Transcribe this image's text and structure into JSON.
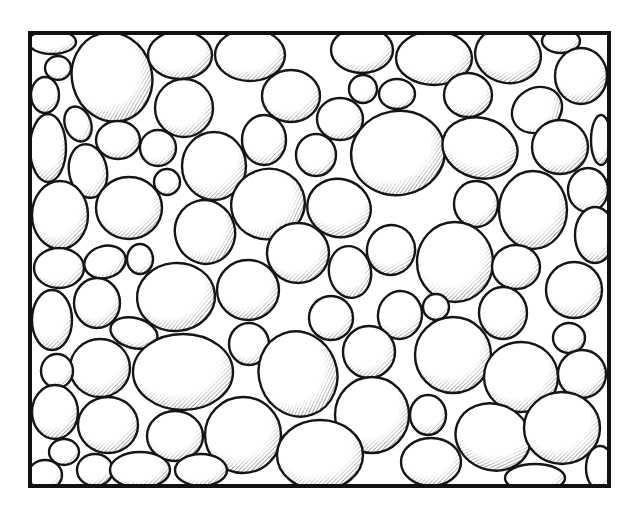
{
  "illustration": {
    "subject": "pebbles packed inside a rectangular frame",
    "style": "black ink line art with hatched shading",
    "colors": {
      "ink": "#151515",
      "background": "#ffffff",
      "hatch": "#555555"
    },
    "frame": {
      "x": 30,
      "y": 33,
      "width": 579,
      "height": 453
    },
    "pebbles": [
      {
        "cx": 52,
        "cy": 42,
        "rx": 24,
        "ry": 12,
        "rot": 0
      },
      {
        "cx": 112,
        "cy": 77,
        "rx": 40,
        "ry": 45,
        "rot": -15
      },
      {
        "cx": 180,
        "cy": 55,
        "rx": 32,
        "ry": 24,
        "rot": 0
      },
      {
        "cx": 250,
        "cy": 55,
        "rx": 35,
        "ry": 26,
        "rot": 0
      },
      {
        "cx": 58,
        "cy": 68,
        "rx": 13,
        "ry": 12,
        "rot": 0
      },
      {
        "cx": 45,
        "cy": 95,
        "rx": 14,
        "ry": 18,
        "rot": 0
      },
      {
        "cx": 184,
        "cy": 108,
        "rx": 29,
        "ry": 29,
        "rot": 0
      },
      {
        "cx": 291,
        "cy": 96,
        "rx": 29,
        "ry": 26,
        "rot": 0
      },
      {
        "cx": 48,
        "cy": 148,
        "rx": 18,
        "ry": 34,
        "rot": 0
      },
      {
        "cx": 78,
        "cy": 124,
        "rx": 13,
        "ry": 18,
        "rot": -20
      },
      {
        "cx": 118,
        "cy": 140,
        "rx": 22,
        "ry": 19,
        "rot": 0
      },
      {
        "cx": 158,
        "cy": 148,
        "rx": 18,
        "ry": 18,
        "rot": 0
      },
      {
        "cx": 88,
        "cy": 171,
        "rx": 19,
        "ry": 27,
        "rot": -10
      },
      {
        "cx": 214,
        "cy": 166,
        "rx": 32,
        "ry": 34,
        "rot": 0
      },
      {
        "cx": 264,
        "cy": 140,
        "rx": 22,
        "ry": 25,
        "rot": 0
      },
      {
        "cx": 167,
        "cy": 182,
        "rx": 13,
        "ry": 13,
        "rot": 0
      },
      {
        "cx": 362,
        "cy": 50,
        "rx": 31,
        "ry": 23,
        "rot": 0
      },
      {
        "cx": 434,
        "cy": 58,
        "rx": 38,
        "ry": 27,
        "rot": 0
      },
      {
        "cx": 508,
        "cy": 55,
        "rx": 33,
        "ry": 28,
        "rot": 10
      },
      {
        "cx": 561,
        "cy": 41,
        "rx": 19,
        "ry": 12,
        "rot": 0
      },
      {
        "cx": 581,
        "cy": 76,
        "rx": 26,
        "ry": 28,
        "rot": 0
      },
      {
        "cx": 363,
        "cy": 89,
        "rx": 14,
        "ry": 14,
        "rot": 0
      },
      {
        "cx": 397,
        "cy": 94,
        "rx": 18,
        "ry": 15,
        "rot": 0
      },
      {
        "cx": 468,
        "cy": 95,
        "rx": 24,
        "ry": 22,
        "rot": 0
      },
      {
        "cx": 340,
        "cy": 119,
        "rx": 23,
        "ry": 21,
        "rot": 0
      },
      {
        "cx": 398,
        "cy": 153,
        "rx": 47,
        "ry": 42,
        "rot": -10
      },
      {
        "cx": 480,
        "cy": 148,
        "rx": 38,
        "ry": 30,
        "rot": 15
      },
      {
        "cx": 537,
        "cy": 110,
        "rx": 26,
        "ry": 22,
        "rot": -30
      },
      {
        "cx": 560,
        "cy": 147,
        "rx": 28,
        "ry": 27,
        "rot": 0
      },
      {
        "cx": 601,
        "cy": 140,
        "rx": 10,
        "ry": 25,
        "rot": 0
      },
      {
        "cx": 316,
        "cy": 155,
        "rx": 20,
        "ry": 21,
        "rot": 0
      },
      {
        "cx": 129,
        "cy": 208,
        "rx": 33,
        "ry": 31,
        "rot": 0
      },
      {
        "cx": 60,
        "cy": 215,
        "rx": 28,
        "ry": 34,
        "rot": 0
      },
      {
        "cx": 205,
        "cy": 232,
        "rx": 30,
        "ry": 32,
        "rot": -15
      },
      {
        "cx": 268,
        "cy": 204,
        "rx": 37,
        "ry": 35,
        "rot": -20
      },
      {
        "cx": 339,
        "cy": 208,
        "rx": 32,
        "ry": 29,
        "rot": 15
      },
      {
        "cx": 476,
        "cy": 204,
        "rx": 22,
        "ry": 23,
        "rot": 0
      },
      {
        "cx": 533,
        "cy": 210,
        "rx": 34,
        "ry": 39,
        "rot": 0
      },
      {
        "cx": 588,
        "cy": 190,
        "rx": 20,
        "ry": 22,
        "rot": 0
      },
      {
        "cx": 595,
        "cy": 235,
        "rx": 20,
        "ry": 28,
        "rot": 0
      },
      {
        "cx": 298,
        "cy": 253,
        "rx": 31,
        "ry": 30,
        "rot": 0
      },
      {
        "cx": 350,
        "cy": 272,
        "rx": 21,
        "ry": 26,
        "rot": -10
      },
      {
        "cx": 391,
        "cy": 250,
        "rx": 24,
        "ry": 25,
        "rot": 15
      },
      {
        "cx": 455,
        "cy": 262,
        "rx": 38,
        "ry": 40,
        "rot": 0
      },
      {
        "cx": 516,
        "cy": 267,
        "rx": 24,
        "ry": 22,
        "rot": 0
      },
      {
        "cx": 574,
        "cy": 290,
        "rx": 28,
        "ry": 28,
        "rot": 0
      },
      {
        "cx": 59,
        "cy": 268,
        "rx": 25,
        "ry": 20,
        "rot": 0
      },
      {
        "cx": 105,
        "cy": 262,
        "rx": 21,
        "ry": 16,
        "rot": -15
      },
      {
        "cx": 140,
        "cy": 259,
        "rx": 13,
        "ry": 15,
        "rot": 0
      },
      {
        "cx": 176,
        "cy": 297,
        "rx": 39,
        "ry": 34,
        "rot": -5
      },
      {
        "cx": 248,
        "cy": 290,
        "rx": 31,
        "ry": 30,
        "rot": 0
      },
      {
        "cx": 97,
        "cy": 303,
        "rx": 23,
        "ry": 25,
        "rot": 0
      },
      {
        "cx": 52,
        "cy": 320,
        "rx": 20,
        "ry": 30,
        "rot": 0
      },
      {
        "cx": 134,
        "cy": 333,
        "rx": 24,
        "ry": 15,
        "rot": 15
      },
      {
        "cx": 331,
        "cy": 318,
        "rx": 22,
        "ry": 22,
        "rot": 0
      },
      {
        "cx": 400,
        "cy": 315,
        "rx": 22,
        "ry": 24,
        "rot": 10
      },
      {
        "cx": 436,
        "cy": 307,
        "rx": 13,
        "ry": 13,
        "rot": 0
      },
      {
        "cx": 503,
        "cy": 313,
        "rx": 24,
        "ry": 26,
        "rot": 0
      },
      {
        "cx": 569,
        "cy": 338,
        "rx": 16,
        "ry": 15,
        "rot": 0
      },
      {
        "cx": 100,
        "cy": 368,
        "rx": 30,
        "ry": 29,
        "rot": 0
      },
      {
        "cx": 183,
        "cy": 372,
        "rx": 50,
        "ry": 38,
        "rot": 0
      },
      {
        "cx": 249,
        "cy": 344,
        "rx": 20,
        "ry": 21,
        "rot": 0
      },
      {
        "cx": 298,
        "cy": 374,
        "rx": 39,
        "ry": 43,
        "rot": -20
      },
      {
        "cx": 369,
        "cy": 352,
        "rx": 26,
        "ry": 26,
        "rot": 0
      },
      {
        "cx": 453,
        "cy": 355,
        "rx": 38,
        "ry": 38,
        "rot": 0
      },
      {
        "cx": 521,
        "cy": 377,
        "rx": 37,
        "ry": 35,
        "rot": 0
      },
      {
        "cx": 582,
        "cy": 374,
        "rx": 24,
        "ry": 24,
        "rot": 0
      },
      {
        "cx": 57,
        "cy": 371,
        "rx": 16,
        "ry": 17,
        "rot": 0
      },
      {
        "cx": 55,
        "cy": 412,
        "rx": 23,
        "ry": 27,
        "rot": 0
      },
      {
        "cx": 108,
        "cy": 425,
        "rx": 30,
        "ry": 28,
        "rot": 0
      },
      {
        "cx": 175,
        "cy": 436,
        "rx": 28,
        "ry": 25,
        "rot": 0
      },
      {
        "cx": 243,
        "cy": 435,
        "rx": 38,
        "ry": 38,
        "rot": 0
      },
      {
        "cx": 372,
        "cy": 415,
        "rx": 37,
        "ry": 38,
        "rot": 0
      },
      {
        "cx": 428,
        "cy": 415,
        "rx": 18,
        "ry": 20,
        "rot": 0
      },
      {
        "cx": 493,
        "cy": 437,
        "rx": 38,
        "ry": 33,
        "rot": 20
      },
      {
        "cx": 562,
        "cy": 428,
        "rx": 38,
        "ry": 36,
        "rot": 0
      },
      {
        "cx": 64,
        "cy": 452,
        "rx": 15,
        "ry": 13,
        "rot": 0
      },
      {
        "cx": 95,
        "cy": 470,
        "rx": 18,
        "ry": 16,
        "rot": 0
      },
      {
        "cx": 140,
        "cy": 470,
        "rx": 30,
        "ry": 18,
        "rot": 0
      },
      {
        "cx": 201,
        "cy": 470,
        "rx": 26,
        "ry": 16,
        "rot": 0
      },
      {
        "cx": 320,
        "cy": 455,
        "rx": 43,
        "ry": 35,
        "rot": 0
      },
      {
        "cx": 431,
        "cy": 462,
        "rx": 30,
        "ry": 24,
        "rot": 0
      },
      {
        "cx": 535,
        "cy": 478,
        "rx": 30,
        "ry": 14,
        "rot": 0
      },
      {
        "cx": 600,
        "cy": 468,
        "rx": 14,
        "ry": 22,
        "rot": 0
      },
      {
        "cx": 45,
        "cy": 475,
        "rx": 17,
        "ry": 15,
        "rot": 0
      }
    ]
  }
}
